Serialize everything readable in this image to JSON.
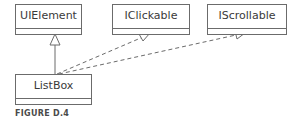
{
  "diagram": {
    "classes": [
      {
        "id": "uielement",
        "name": "UIElement"
      },
      {
        "id": "iclickable",
        "name": "IClickable"
      },
      {
        "id": "iscrollable",
        "name": "IScrollable"
      },
      {
        "id": "listbox",
        "name": "ListBox"
      }
    ],
    "relations": [
      {
        "from": "ListBox",
        "to": "UIElement",
        "type": "generalization"
      },
      {
        "from": "ListBox",
        "to": "IClickable",
        "type": "realization"
      },
      {
        "from": "ListBox",
        "to": "IScrollable",
        "type": "realization"
      }
    ],
    "colors": {
      "line": "#6b6b6b",
      "text": "#3a3a3a"
    }
  },
  "caption": "FIGURE D.4"
}
